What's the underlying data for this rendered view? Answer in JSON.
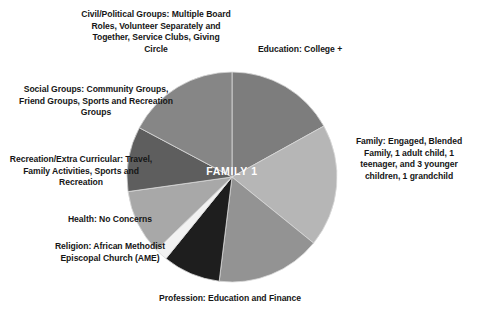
{
  "figure": {
    "center_label": "FAMILY 1",
    "background_color": "#ffffff",
    "text_color": "#161616",
    "center_label_color": "#ffffff"
  },
  "labels": {
    "civil": "Civil/Political Groups: Multiple Board Roles, Volunteer Separately and Together, Service Clubs, Giving Circle",
    "education": "Education: College +",
    "social": "Social Groups: Community Groups, Friend Groups, Sports and Recreation Groups",
    "family": "Family: Engaged, Blended Family, 1 adult child, 1 teenager, and 3 younger children, 1 grandchild",
    "recreation": "Recreation/Extra Curricular: Travel, Family Activities, Sports and Recreation",
    "health": "Health: No Concerns",
    "religion": "Religion: African Methodist Episcopal Church (AME)",
    "profession": "Profession:  Education and Finance"
  },
  "chart_data": {
    "type": "pie",
    "title": "FAMILY 1",
    "legend": "none",
    "start_angle_deg": 0,
    "direction": "clockwise",
    "categories": [
      "Education: College +",
      "Family: Engaged, Blended Family, 1 adult child, 1 teenager, and 3 younger children, 1 grandchild",
      "Profession:  Education and Finance",
      "Religion: African Methodist Episcopal Church (AME)",
      "Health: No Concerns",
      "Recreation/Extra Curricular: Travel, Family Activities, Sports and Recreation",
      "Social Groups: Community Groups, Friend Groups, Sports and Recreation Groups",
      "Civil/Political Groups: Multiple Board Roles, Volunteer Separately and Together, Service Clubs, Giving Circle"
    ],
    "short_names": [
      "Education",
      "Family",
      "Profession",
      "Religion",
      "Health",
      "Recreation/Extra Curricular",
      "Social Groups",
      "Civil/Political Groups"
    ],
    "values": [
      17,
      19,
      16,
      9,
      2,
      10,
      10,
      17
    ],
    "angles_deg": [
      61,
      68,
      58,
      32,
      7,
      36,
      36,
      62
    ],
    "colors": [
      "#7d7d7d",
      "#b6b6b6",
      "#939393",
      "#1e1e1e",
      "#f2f2f2",
      "#a8a8a8",
      "#5e5e5e",
      "#868686"
    ],
    "slice_edge_color": "#d9d9d9"
  },
  "geometry": {
    "center_x": 232,
    "center_y": 177,
    "radius": 105
  }
}
